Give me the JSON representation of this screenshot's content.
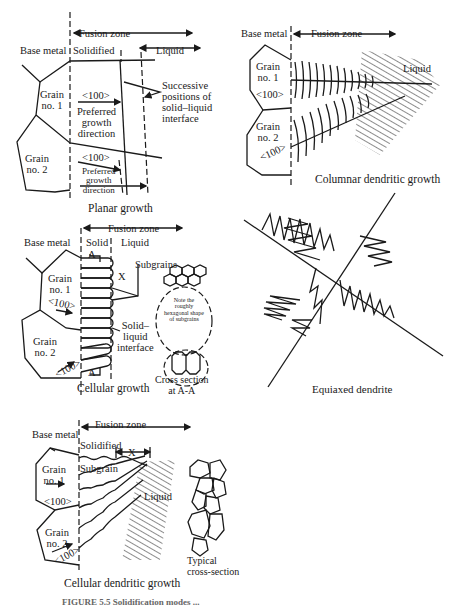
{
  "figure": {
    "caption_partial": "FIGURE 5.5  Solidification modes ..."
  },
  "panels": {
    "planar": {
      "title": "Planar growth",
      "base_metal": "Base metal",
      "fusion_zone": "Fusion zone",
      "solidified": "Solidified",
      "liquid": "Liquid",
      "grain1": "Grain\nno. 1",
      "grain2": "Grain\nno. 2",
      "dir1": "<100>",
      "dir2": "<100>",
      "pref1": "Preferred\ngrowth\ndirection",
      "pref2": "Preferred\ngrowth\ndirection",
      "interface_note": "Successive\npositions of\nsolid–liquid\ninterface"
    },
    "columnar": {
      "title": "Columnar dendritic growth",
      "base_metal": "Base metal",
      "fusion_zone": "Fusion zone",
      "liquid": "Liquid",
      "grain1": "Grain\nno. 1",
      "grain2": "Grain\nno. 2",
      "dir1": "<100>",
      "dir2": "<100>"
    },
    "cellular": {
      "title": "Cellular growth",
      "base_metal": "Base metal",
      "fusion_zone": "Fusion zone",
      "solid": "Solid",
      "liquid": "Liquid",
      "section_top": "A",
      "section_bottom": "A",
      "x_label": "X",
      "subgrains": "Subgrains",
      "interface": "Solid–\nliquid\ninterface",
      "grain1": "Grain\nno. 1",
      "grain2": "Grain\nno. 2",
      "dir1": "<100>",
      "dir2": "<100>",
      "note": "Note the\nroughly\nhexagonal shape\nof subgrains",
      "cross_section": "Cross section\nat A-A"
    },
    "equiaxed": {
      "title": "Equiaxed dendrite"
    },
    "cellular_dendritic": {
      "title": "Cellular dendritic growth",
      "base_metal": "Base metal",
      "fusion_zone": "Fusion zone",
      "solidified": "Solidified",
      "x_label": "X",
      "subgrain": "Subgrain",
      "liquid": "Liquid",
      "grain1": "Grain\nno. 1",
      "grain2": "Grain\nno. 2",
      "dir1": "<100>",
      "dir2": "<100>",
      "typical": "Typical\ncross-section"
    }
  }
}
